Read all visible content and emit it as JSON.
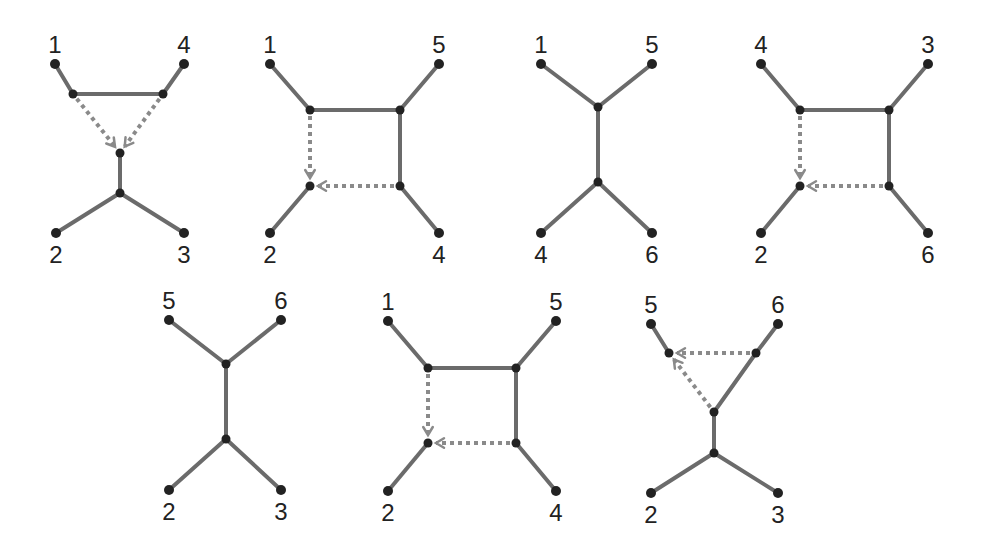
{
  "colors": {
    "edge": "#6b6b6b",
    "reticulation": "#8a8a8a",
    "node": "#222222",
    "label": "#222222"
  },
  "diagrams": [
    {
      "id": "d1",
      "labels": [
        "1",
        "4",
        "2",
        "3"
      ],
      "nodes": {
        "l1": [
          55,
          64
        ],
        "l4": [
          184,
          64
        ],
        "a": [
          73,
          94
        ],
        "b": [
          163,
          94
        ],
        "h": [
          120,
          153
        ],
        "j": [
          120,
          193
        ],
        "l2": [
          56,
          233
        ],
        "l3": [
          184,
          233
        ]
      },
      "edges": [
        [
          "l1",
          "a"
        ],
        [
          "l4",
          "b"
        ],
        [
          "a",
          "b"
        ],
        [
          "h",
          "j"
        ],
        [
          "j",
          "l2"
        ],
        [
          "j",
          "l3"
        ]
      ],
      "reticulations": [
        [
          "a",
          "h"
        ],
        [
          "b",
          "h"
        ]
      ]
    },
    {
      "id": "d2",
      "labels": [
        "1",
        "5",
        "2",
        "4"
      ],
      "nodes": {
        "l1": [
          270,
          64
        ],
        "l5": [
          439,
          64
        ],
        "tl": [
          310,
          110
        ],
        "tr": [
          400,
          110
        ],
        "bl": [
          310,
          186
        ],
        "br": [
          400,
          186
        ],
        "l2": [
          270,
          233
        ],
        "l4": [
          439,
          233
        ]
      },
      "edges": [
        [
          "l1",
          "tl"
        ],
        [
          "l5",
          "tr"
        ],
        [
          "tl",
          "tr"
        ],
        [
          "tr",
          "br"
        ],
        [
          "bl",
          "l2"
        ],
        [
          "br",
          "l4"
        ]
      ],
      "reticulations": [
        [
          "tl",
          "bl"
        ],
        [
          "br",
          "bl"
        ]
      ]
    },
    {
      "id": "d3",
      "labels": [
        "1",
        "5",
        "4",
        "6"
      ],
      "nodes": {
        "l1": [
          541,
          64
        ],
        "l5": [
          652,
          64
        ],
        "u": [
          598,
          107
        ],
        "d": [
          598,
          182
        ],
        "l4": [
          541,
          233
        ],
        "l6": [
          652,
          233
        ]
      },
      "edges": [
        [
          "l1",
          "u"
        ],
        [
          "l5",
          "u"
        ],
        [
          "u",
          "d"
        ],
        [
          "d",
          "l4"
        ],
        [
          "d",
          "l6"
        ]
      ],
      "reticulations": []
    },
    {
      "id": "d4",
      "labels": [
        "4",
        "3",
        "2",
        "6"
      ],
      "nodes": {
        "l4": [
          761,
          64
        ],
        "l3": [
          928,
          64
        ],
        "tl": [
          800,
          110
        ],
        "tr": [
          889,
          110
        ],
        "bl": [
          800,
          186
        ],
        "br": [
          889,
          186
        ],
        "l2": [
          761,
          233
        ],
        "l6": [
          928,
          233
        ]
      },
      "edges": [
        [
          "l4",
          "tl"
        ],
        [
          "l3",
          "tr"
        ],
        [
          "tl",
          "tr"
        ],
        [
          "tr",
          "br"
        ],
        [
          "bl",
          "l2"
        ],
        [
          "br",
          "l6"
        ]
      ],
      "reticulations": [
        [
          "tl",
          "bl"
        ],
        [
          "br",
          "bl"
        ]
      ]
    },
    {
      "id": "d5",
      "labels": [
        "5",
        "6",
        "2",
        "3"
      ],
      "nodes": {
        "l5": [
          169,
          320
        ],
        "l6": [
          281,
          320
        ],
        "u": [
          226,
          364
        ],
        "d": [
          226,
          439
        ],
        "l2": [
          169,
          490
        ],
        "l3": [
          281,
          490
        ]
      },
      "edges": [
        [
          "l5",
          "u"
        ],
        [
          "l6",
          "u"
        ],
        [
          "u",
          "d"
        ],
        [
          "d",
          "l2"
        ],
        [
          "d",
          "l3"
        ]
      ],
      "reticulations": []
    },
    {
      "id": "d6",
      "labels": [
        "1",
        "5",
        "2",
        "4"
      ],
      "nodes": {
        "l1": [
          388,
          321
        ],
        "l5": [
          556,
          321
        ],
        "tl": [
          428,
          368
        ],
        "tr": [
          516,
          368
        ],
        "bl": [
          428,
          443
        ],
        "br": [
          516,
          443
        ],
        "l2": [
          388,
          491
        ],
        "l4": [
          556,
          491
        ]
      },
      "edges": [
        [
          "l1",
          "tl"
        ],
        [
          "l5",
          "tr"
        ],
        [
          "tl",
          "tr"
        ],
        [
          "tr",
          "br"
        ],
        [
          "bl",
          "l2"
        ],
        [
          "br",
          "l4"
        ]
      ],
      "reticulations": [
        [
          "tl",
          "bl"
        ],
        [
          "br",
          "bl"
        ]
      ]
    },
    {
      "id": "d7",
      "labels": [
        "5",
        "6",
        "2",
        "3"
      ],
      "nodes": {
        "l5": [
          651,
          324
        ],
        "l6": [
          778,
          324
        ],
        "h": [
          669,
          353
        ],
        "b": [
          756,
          353
        ],
        "m": [
          714,
          412
        ],
        "j": [
          714,
          453
        ],
        "l2": [
          651,
          493
        ],
        "l3": [
          778,
          493
        ]
      },
      "edges": [
        [
          "l5",
          "h"
        ],
        [
          "l6",
          "b"
        ],
        [
          "b",
          "m"
        ],
        [
          "m",
          "j"
        ],
        [
          "j",
          "l2"
        ],
        [
          "j",
          "l3"
        ]
      ],
      "reticulations": [
        [
          "b",
          "h"
        ],
        [
          "m",
          "h"
        ]
      ]
    }
  ],
  "label_positions": [
    {
      "text": "1",
      "x": 55,
      "y": 53
    },
    {
      "text": "4",
      "x": 184,
      "y": 53
    },
    {
      "text": "2",
      "x": 56,
      "y": 263
    },
    {
      "text": "3",
      "x": 184,
      "y": 263
    },
    {
      "text": "1",
      "x": 270,
      "y": 53
    },
    {
      "text": "5",
      "x": 439,
      "y": 53
    },
    {
      "text": "2",
      "x": 270,
      "y": 263
    },
    {
      "text": "4",
      "x": 439,
      "y": 263
    },
    {
      "text": "1",
      "x": 541,
      "y": 53
    },
    {
      "text": "5",
      "x": 652,
      "y": 53
    },
    {
      "text": "4",
      "x": 541,
      "y": 263
    },
    {
      "text": "6",
      "x": 652,
      "y": 263
    },
    {
      "text": "4",
      "x": 761,
      "y": 53
    },
    {
      "text": "3",
      "x": 928,
      "y": 53
    },
    {
      "text": "2",
      "x": 761,
      "y": 263
    },
    {
      "text": "6",
      "x": 928,
      "y": 263
    },
    {
      "text": "5",
      "x": 169,
      "y": 309
    },
    {
      "text": "6",
      "x": 281,
      "y": 309
    },
    {
      "text": "2",
      "x": 169,
      "y": 520
    },
    {
      "text": "3",
      "x": 281,
      "y": 520
    },
    {
      "text": "1",
      "x": 388,
      "y": 310
    },
    {
      "text": "5",
      "x": 556,
      "y": 310
    },
    {
      "text": "2",
      "x": 388,
      "y": 521
    },
    {
      "text": "4",
      "x": 556,
      "y": 521
    },
    {
      "text": "5",
      "x": 651,
      "y": 313
    },
    {
      "text": "6",
      "x": 778,
      "y": 313
    },
    {
      "text": "2",
      "x": 651,
      "y": 523
    },
    {
      "text": "3",
      "x": 778,
      "y": 523
    }
  ]
}
